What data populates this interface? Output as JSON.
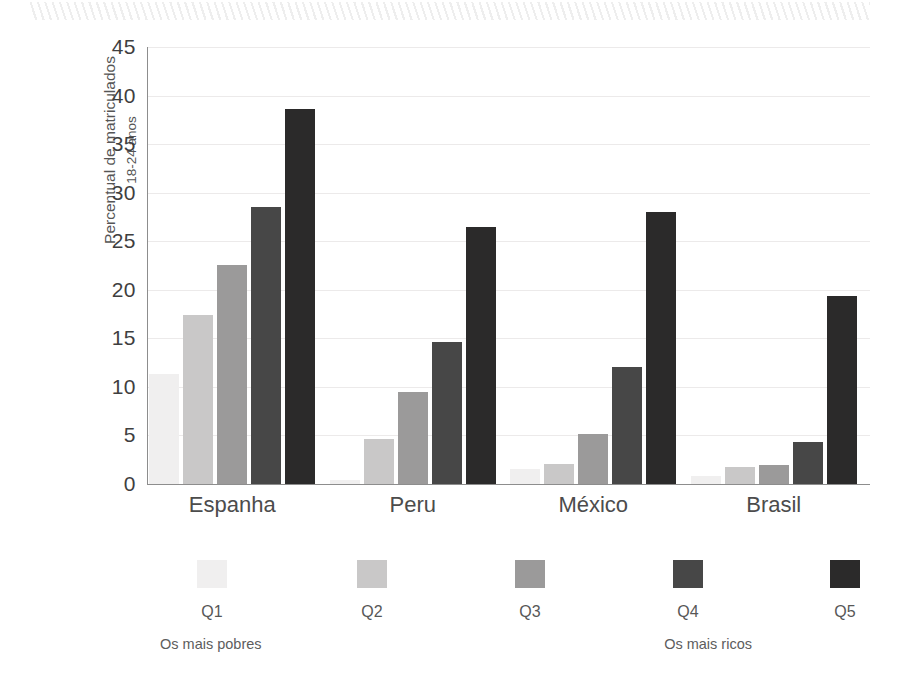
{
  "chart_data": {
    "type": "bar",
    "title": "",
    "xlabel": "",
    "ylabel": "Percentual de matriculados",
    "ylabel_line2": "18-24 anos",
    "ylim": [
      0,
      45
    ],
    "yticks": [
      0,
      5,
      10,
      15,
      20,
      25,
      30,
      35,
      40,
      45
    ],
    "ytick_labels": [
      "0",
      "5",
      "10",
      "15",
      "20",
      "25",
      "30",
      "35",
      "40",
      "45"
    ],
    "grid": true,
    "legend_position": "bottom",
    "categories": [
      "Espanha",
      "Peru",
      "México",
      "Brasil"
    ],
    "series": [
      {
        "name": "Q1",
        "color": "#f0efef",
        "values": [
          11.3,
          0.4,
          1.5,
          0.8
        ]
      },
      {
        "name": "Q2",
        "color": "#c9c8c8",
        "values": [
          17.4,
          4.6,
          2.1,
          1.8
        ]
      },
      {
        "name": "Q3",
        "color": "#9b9a9a",
        "values": [
          22.6,
          9.5,
          5.2,
          2.0
        ]
      },
      {
        "name": "Q4",
        "color": "#474747",
        "values": [
          28.5,
          14.6,
          12.0,
          4.3
        ]
      },
      {
        "name": "Q5",
        "color": "#2b2a2a",
        "values": [
          38.6,
          26.5,
          28.0,
          19.4
        ]
      }
    ],
    "legend_notes": {
      "left": "Os mais pobres",
      "right": "Os mais ricos"
    }
  }
}
